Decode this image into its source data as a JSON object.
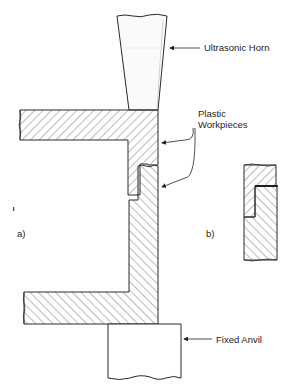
{
  "diagram": {
    "labels": {
      "horn": "Ultrasonic Horn",
      "workpieces_line1": "Plastic",
      "workpieces_line2": "Workpieces",
      "anvil": "Fixed Anvil",
      "panel_a": "a)",
      "panel_b": "b)"
    },
    "colors": {
      "stroke": "#2a2a2a",
      "hatch": "#555555",
      "background": "#ffffff"
    }
  }
}
